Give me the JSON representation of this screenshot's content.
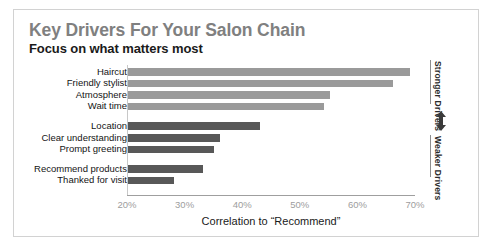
{
  "page": {
    "scan_sliver_left": "",
    "scan_sliver_mid": "",
    "scan_sliver_right": ""
  },
  "chart_data": {
    "type": "bar",
    "orientation": "horizontal",
    "title": "Key Drivers For Your Salon Chain",
    "subtitle": "Focus on what matters most",
    "xlabel": "Correlation to “Recommend”",
    "ylabel": "",
    "xlim": [
      20,
      70
    ],
    "xticks": [
      "20%",
      "30%",
      "40%",
      "50%",
      "60%",
      "70%"
    ],
    "xtick_values": [
      20,
      30,
      40,
      50,
      60,
      70
    ],
    "grid": false,
    "legend": "none",
    "value_unit": "%",
    "categories": [
      "Haircut",
      "Friendly stylist",
      "Atmosphere",
      "Wait time",
      "Location",
      "Clear understanding",
      "Prompt greeting",
      "Recommend products",
      "Thanked for visit"
    ],
    "values": [
      69,
      66,
      55,
      54,
      43,
      36,
      35,
      33,
      28
    ],
    "groups": [
      {
        "name": "Stronger Drivers",
        "color": "#9a9a9a",
        "categories": [
          "Haircut",
          "Friendly stylist",
          "Atmosphere",
          "Wait time"
        ],
        "values": [
          69,
          66,
          55,
          54
        ]
      },
      {
        "name": "Weaker Drivers",
        "color": "#585858",
        "categories": [
          "Location",
          "Clear understanding",
          "Prompt greeting",
          "Recommend products",
          "Thanked for visit"
        ],
        "values": [
          43,
          36,
          35,
          33,
          28
        ]
      }
    ],
    "bars": [
      {
        "label": "Haircut",
        "value": 69,
        "group": "Stronger Drivers",
        "color": "#9a9a9a"
      },
      {
        "label": "Friendly stylist",
        "value": 66,
        "group": "Stronger Drivers",
        "color": "#9a9a9a"
      },
      {
        "label": "Atmosphere",
        "value": 55,
        "group": "Stronger Drivers",
        "color": "#9a9a9a"
      },
      {
        "label": "Wait time",
        "value": 54,
        "group": "Stronger Drivers",
        "color": "#9a9a9a"
      },
      {
        "label": "Location",
        "value": 43,
        "group": "Weaker Drivers",
        "color": "#585858"
      },
      {
        "label": "Clear understanding",
        "value": 36,
        "group": "Weaker Drivers",
        "color": "#585858"
      },
      {
        "label": "Prompt greeting",
        "value": 35,
        "group": "Weaker Drivers",
        "color": "#585858"
      },
      {
        "label": "Recommend products",
        "value": 33,
        "group": "Weaker Drivers",
        "color": "#585858"
      },
      {
        "label": "Thanked for visit",
        "value": 28,
        "group": "Weaker Drivers",
        "color": "#585858"
      }
    ],
    "annotations": {
      "top_label": "Stronger Drivers",
      "bottom_label": "Weaker Drivers",
      "arrow": "double-headed-vertical-arrow"
    }
  },
  "colors": {
    "title": "#808080",
    "subtitle": "#1a1a1a",
    "bar_strong": "#9a9a9a",
    "bar_weak": "#585858",
    "axis": "#9f9f9f",
    "tick_text": "#9d9d9d",
    "border": "#d2d2d2"
  }
}
